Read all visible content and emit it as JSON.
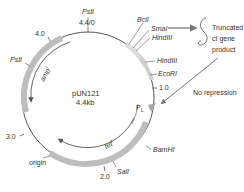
{
  "diagram": {
    "title": "pUN121",
    "size": "4.4kb",
    "colors": {
      "backbone": "#555555",
      "gene_block": "#b8b8b8",
      "promoter": "#a8a8a8",
      "text": "#333333",
      "arrow": "#666666"
    },
    "scale_ticks": [
      {
        "label": "4.4/0"
      },
      {
        "label": "4.0"
      },
      {
        "label": "3.0"
      },
      {
        "label": "2.0"
      },
      {
        "label": "1.0"
      }
    ],
    "restriction_sites": [
      {
        "label": "PstI",
        "position": "top"
      },
      {
        "label": "BclI"
      },
      {
        "label": "SmaI"
      },
      {
        "label": "HindIII",
        "index": 1
      },
      {
        "label": "HindIII",
        "index": 2
      },
      {
        "label": "EcoRI"
      },
      {
        "label": "BamHI"
      },
      {
        "label": "SalI"
      },
      {
        "label": "PstI",
        "position": "left"
      }
    ],
    "genes": [
      {
        "label": "amp",
        "superscript": "r"
      },
      {
        "label": "tet",
        "superscript": "r"
      }
    ],
    "features": {
      "origin": "origin",
      "promoter": "P",
      "promoter_sub": "L"
    },
    "annotations": {
      "truncated_line1": "Truncated",
      "truncated_line2": "cI gene",
      "truncated_line3": "product",
      "no_repression": "No repression"
    }
  }
}
